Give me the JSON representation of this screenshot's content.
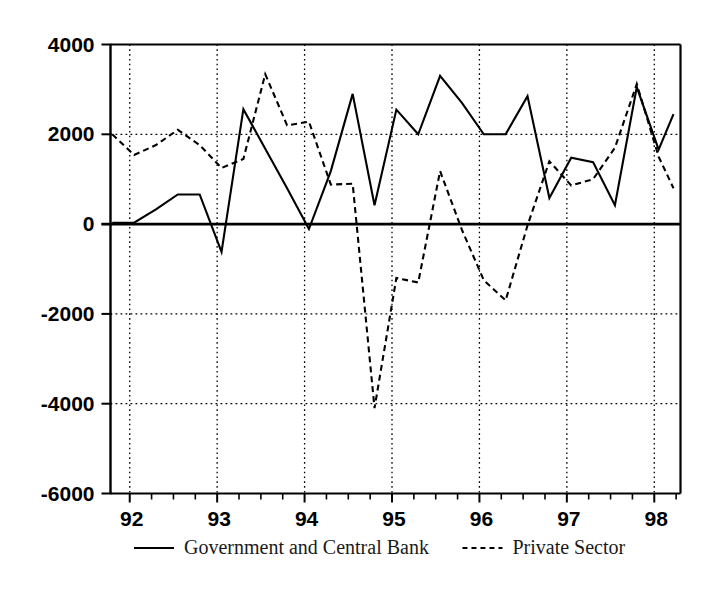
{
  "chart_data": {
    "type": "line",
    "title": "",
    "subtitle": "",
    "xlabel": "",
    "ylabel": "",
    "xlim": [
      1991.78,
      1998.3
    ],
    "ylim": [
      -6000,
      4000
    ],
    "grid": true,
    "grid_axis": "both",
    "legend_position": "bottom",
    "y_ticks": [
      4000,
      2000,
      0,
      -2000,
      -4000,
      -6000
    ],
    "y_tick_labels": [
      "4000",
      "2000",
      "0",
      "-2000",
      "-4000",
      "-6000"
    ],
    "x_ticks": [
      1992,
      1993,
      1994,
      1995,
      1996,
      1997,
      1998
    ],
    "x_tick_labels": [
      "92",
      "93",
      "94",
      "95",
      "96",
      "97",
      "98"
    ],
    "x_minor_tick_interval": 0.25,
    "series": [
      {
        "name": "Government and Central Bank",
        "style": "solid",
        "color": "#000000",
        "x": [
          1991.8,
          1992.05,
          1992.3,
          1992.55,
          1992.8,
          1993.05,
          1993.3,
          1993.55,
          1993.8,
          1994.05,
          1994.3,
          1994.55,
          1994.8,
          1995.05,
          1995.3,
          1995.55,
          1995.8,
          1996.05,
          1996.3,
          1996.55,
          1996.8,
          1997.05,
          1997.3,
          1997.55,
          1997.8,
          1998.05,
          1998.22
        ],
        "values": [
          30,
          30,
          330,
          660,
          660,
          -620,
          2560,
          1680,
          800,
          -110,
          1180,
          2900,
          420,
          2550,
          2000,
          3300,
          2700,
          2000,
          2000,
          2850,
          580,
          1480,
          1380,
          420,
          3050,
          1660,
          2450
        ]
      },
      {
        "name": "Private Sector",
        "style": "dashed",
        "color": "#000000",
        "x": [
          1991.8,
          1992.05,
          1992.3,
          1992.55,
          1992.8,
          1993.05,
          1993.3,
          1993.55,
          1993.8,
          1994.05,
          1994.3,
          1994.55,
          1994.8,
          1995.05,
          1995.3,
          1995.55,
          1995.8,
          1996.05,
          1996.3,
          1996.55,
          1996.8,
          1997.05,
          1997.3,
          1997.55,
          1997.8,
          1998.05,
          1998.22
        ],
        "values": [
          2000,
          1540,
          1760,
          2100,
          1760,
          1250,
          1450,
          3340,
          2200,
          2280,
          880,
          900,
          -4100,
          -1200,
          -1300,
          1180,
          -130,
          -1250,
          -1700,
          -30,
          1400,
          860,
          1000,
          1700,
          3120,
          1500,
          800
        ]
      }
    ]
  },
  "legend": {
    "items": [
      {
        "label": "Government and Central Bank",
        "style": "solid"
      },
      {
        "label": "Private Sector",
        "style": "dashed"
      }
    ]
  }
}
